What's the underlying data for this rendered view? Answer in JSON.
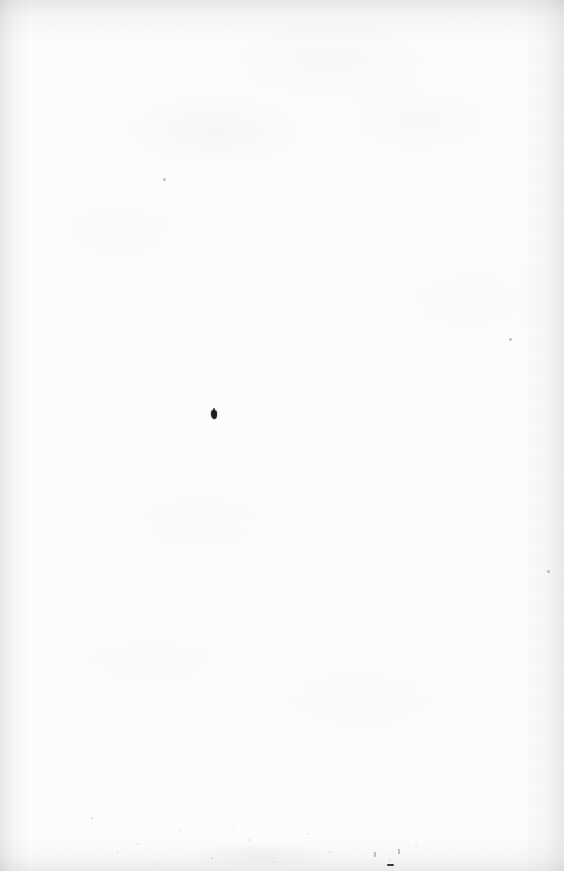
{
  "page": {
    "kind": "scanned-blank-page",
    "width_px": 564,
    "height_px": 871,
    "text_content": "",
    "paper_color": "#fdfdfd",
    "ink_color": "#1d1d1f",
    "edge_shadow_color": "#78787d"
  },
  "artifacts": {
    "ink_blot": {
      "name": "ink-blot",
      "x": 211,
      "y": 410,
      "width": 6,
      "height": 9,
      "color": "#1d1d1f"
    },
    "faint_specks": [
      {
        "name": "faint-speck-upper-right",
        "x": 509,
        "y": 338,
        "color": "#9696a0"
      },
      {
        "name": "faint-speck-right-mid",
        "x": 547,
        "y": 570,
        "color": "#9696a0"
      },
      {
        "name": "faint-speck-upper-left",
        "x": 163,
        "y": 178,
        "color": "#9696a0"
      }
    ],
    "bottom_dash": {
      "name": "bottom-edge-dash",
      "x": 387,
      "y": 864,
      "width": 7,
      "height": 2,
      "color": "#37373c"
    },
    "bottom_ticks": [
      {
        "name": "bottom-tick-a",
        "x": 374,
        "y": 852
      },
      {
        "name": "bottom-tick-b",
        "x": 398,
        "y": 849
      }
    ],
    "dust_band": {
      "name": "dust-speckle-band",
      "top": 800,
      "left": 60,
      "right": 90,
      "height": 71
    },
    "edges": {
      "top_band_height": 42,
      "left_band_width": 30,
      "right_band_width": 44,
      "bottom_band_height": 34
    }
  }
}
